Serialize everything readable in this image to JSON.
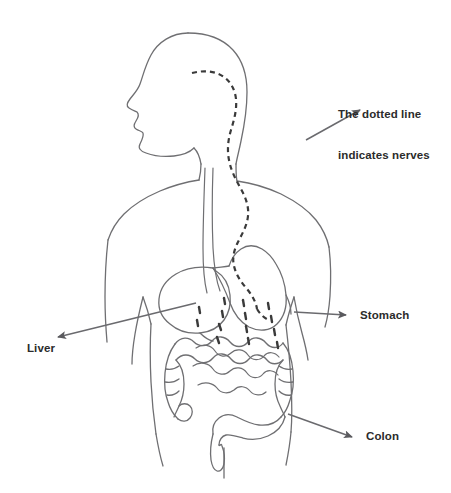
{
  "diagram": {
    "view": "left profile upper body line drawing",
    "colors": {
      "background": "#ffffff",
      "body_outline": "#6f6f72",
      "organ_outline": "#6f6f72",
      "nerve_dashes": "#3a3a3a",
      "arrow": "#6a6a6e",
      "arrowhead": "#5a5a5e",
      "label_text": "#2b2b2b"
    },
    "labels": [
      {
        "name": "nerves",
        "line1": "The dotted line",
        "line2": "indicates nerves",
        "arrow_from": [
          306,
          140
        ],
        "arrow_to": [
          362,
          108
        ]
      },
      {
        "name": "stomach",
        "line1": "Stomach",
        "line2": "",
        "arrow_from": [
          294,
          312
        ],
        "arrow_to": [
          348,
          315
        ]
      },
      {
        "name": "liver",
        "line1": "Liver",
        "line2": "",
        "arrow_from": [
          196,
          303
        ],
        "arrow_to": [
          56,
          338
        ]
      },
      {
        "name": "colon",
        "line1": "Colon",
        "line2": "",
        "arrow_from": [
          288,
          414
        ],
        "arrow_to": [
          354,
          437
        ]
      }
    ],
    "organs": [
      "head",
      "neck",
      "torso",
      "left-arm",
      "right-arm",
      "thighs",
      "esophagus",
      "liver",
      "stomach",
      "small-intestine",
      "colon-ascending",
      "colon-transverse",
      "colon-descending",
      "sigmoid-rectum"
    ]
  }
}
